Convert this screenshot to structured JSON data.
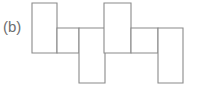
{
  "figure": {
    "label": "(b)",
    "caption_position": "left",
    "background_color": "#ffffff",
    "stroke_color": "#8a8a8a",
    "fill_color": "#ffffff",
    "stroke_width": 1.1,
    "width": 200,
    "height": 89,
    "shape_name": "hexomino-net",
    "cell_count": 6,
    "cells": [
      {
        "name": "cell-top-left",
        "x": 32,
        "y": 3,
        "w": 25,
        "h": 50
      },
      {
        "name": "cell-mid-left",
        "x": 57,
        "y": 28,
        "w": 22,
        "h": 25
      },
      {
        "name": "cell-bottom-left",
        "x": 79,
        "y": 28,
        "w": 26,
        "h": 55
      },
      {
        "name": "cell-top-right",
        "x": 104,
        "y": 3,
        "w": 27,
        "h": 50
      },
      {
        "name": "cell-mid-right",
        "x": 131,
        "y": 28,
        "w": 27,
        "h": 25
      },
      {
        "name": "cell-bottom-right",
        "x": 158,
        "y": 28,
        "w": 25,
        "h": 55
      }
    ]
  }
}
